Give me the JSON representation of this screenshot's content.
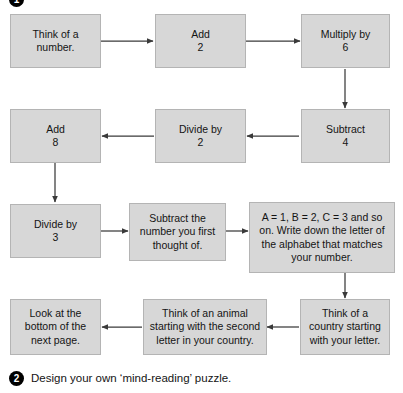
{
  "page": {
    "background_color": "#ffffff",
    "box_fill_color": "#d7d7d7",
    "box_border_color": "#b4b4b4",
    "connector_color": "#3a3a3a",
    "marker_color": "#000000"
  },
  "markers": {
    "step_one": "1",
    "step_two": "2"
  },
  "flowchart": {
    "type": "flowchart",
    "title": "Mind-reading number puzzle",
    "direction": "serpentine (left-to-right, then right-to-left)",
    "nodes": [
      {
        "id": "n1",
        "row": 1,
        "text": "Think of a\nnumber."
      },
      {
        "id": "n2",
        "row": 1,
        "text": "Add\n2"
      },
      {
        "id": "n3",
        "row": 1,
        "text": "Multiply by\n6"
      },
      {
        "id": "n4",
        "row": 2,
        "text": "Subtract\n4"
      },
      {
        "id": "n5",
        "row": 2,
        "text": "Divide by\n2"
      },
      {
        "id": "n6",
        "row": 2,
        "text": "Add\n8"
      },
      {
        "id": "n7",
        "row": 3,
        "text": "Divide by\n3"
      },
      {
        "id": "n8",
        "row": 3,
        "text": "Subtract the\nnumber you first\nthought of."
      },
      {
        "id": "n9",
        "row": 3,
        "text": "A = 1, B = 2, C = 3 and so on. Write down the letter of the alphabet that matches your number."
      },
      {
        "id": "n10",
        "row": 4,
        "text": "Think of a\ncountry starting\nwith your letter."
      },
      {
        "id": "n11",
        "row": 4,
        "text": "Think of an animal\nstarting with the second\nletter in your country."
      },
      {
        "id": "n12",
        "row": 4,
        "text": "Look at the\nbottom of the\nnext page."
      }
    ],
    "edges": [
      {
        "from": "n1",
        "to": "n2",
        "direction": "right"
      },
      {
        "from": "n2",
        "to": "n3",
        "direction": "right"
      },
      {
        "from": "n3",
        "to": "n4",
        "direction": "down"
      },
      {
        "from": "n4",
        "to": "n5",
        "direction": "left"
      },
      {
        "from": "n5",
        "to": "n6",
        "direction": "left"
      },
      {
        "from": "n6",
        "to": "n7",
        "direction": "down"
      },
      {
        "from": "n7",
        "to": "n8",
        "direction": "right"
      },
      {
        "from": "n8",
        "to": "n9",
        "direction": "right"
      },
      {
        "from": "n9",
        "to": "n10",
        "direction": "down"
      },
      {
        "from": "n10",
        "to": "n11",
        "direction": "left"
      },
      {
        "from": "n11",
        "to": "n12",
        "direction": "left"
      }
    ]
  },
  "footer": {
    "instruction": "Design your own ‘mind-reading’ puzzle."
  }
}
